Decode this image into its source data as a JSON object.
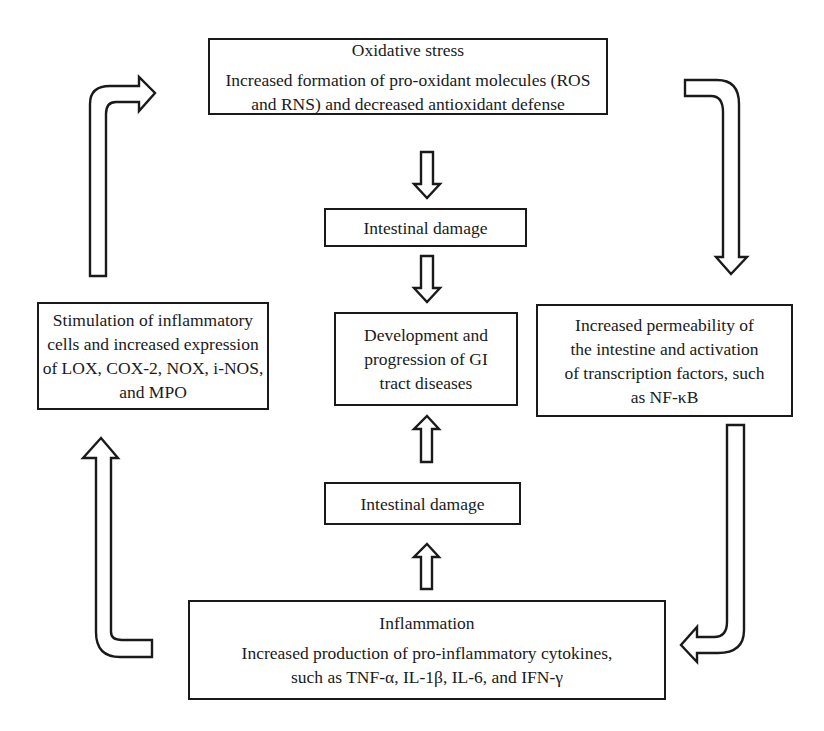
{
  "diagram": {
    "type": "cycle-flowchart",
    "nodes": {
      "oxidative_stress": {
        "title": "Oxidative stress",
        "lines": [
          "Increased formation of pro-oxidant molecules (ROS",
          "and RNS) and decreased antioxidant defense"
        ]
      },
      "intestinal_damage_top": {
        "lines": [
          "Intestinal damage"
        ]
      },
      "gi_disease": {
        "lines": [
          "Development and",
          "progression of GI",
          "tract diseases"
        ]
      },
      "intestinal_damage_bottom": {
        "lines": [
          "Intestinal damage"
        ]
      },
      "permeability": {
        "lines": [
          "Increased permeability of",
          "the intestine and activation",
          "of transcription factors, such",
          "as NF-κB"
        ]
      },
      "inflammation": {
        "title": "Inflammation",
        "lines": [
          "Increased production of pro-inflammatory cytokines,",
          "such as TNF-α, IL-1β, IL-6, and IFN-γ"
        ]
      },
      "inflammatory_cells": {
        "lines": [
          "Stimulation of inflammatory",
          "cells and increased expression",
          "of LOX, COX-2, NOX, i-NOS,",
          "and MPO"
        ]
      }
    },
    "edges": [
      {
        "from": "oxidative_stress",
        "to": "intestinal_damage_top",
        "arrow": "down-arrow-icon"
      },
      {
        "from": "intestinal_damage_top",
        "to": "gi_disease",
        "arrow": "down-arrow-icon"
      },
      {
        "from": "intestinal_damage_bottom",
        "to": "gi_disease",
        "arrow": "up-arrow-icon"
      },
      {
        "from": "inflammation",
        "to": "intestinal_damage_bottom",
        "arrow": "up-arrow-icon"
      },
      {
        "from": "oxidative_stress",
        "to": "permeability",
        "arrow": "bent-down-arrow-icon"
      },
      {
        "from": "permeability",
        "to": "inflammation",
        "arrow": "bent-left-arrow-icon"
      },
      {
        "from": "inflammation",
        "to": "inflammatory_cells",
        "arrow": "bent-up-arrow-icon"
      },
      {
        "from": "inflammatory_cells",
        "to": "oxidative_stress",
        "arrow": "bent-right-arrow-icon"
      }
    ],
    "colors": {
      "stroke": "#1a1a1a",
      "fill": "#ffffff",
      "background": "#ffffff"
    }
  }
}
